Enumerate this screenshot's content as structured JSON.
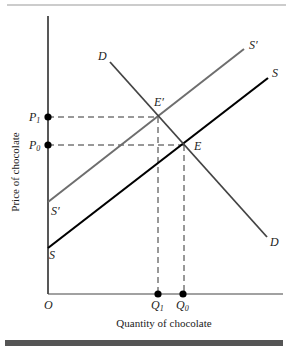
{
  "diagram": {
    "type": "supply-demand",
    "axes": {
      "x_label": "Quantity of chocolate",
      "y_label": "Price of chocolate",
      "origin_label": "O"
    },
    "curves": {
      "demand": {
        "label_start": "D",
        "label_end": "D",
        "color": "#444444"
      },
      "supply": {
        "label_start": "S",
        "label_end": "S",
        "color": "#000000"
      },
      "supply_shifted": {
        "label_start": "S′",
        "label_end": "S′",
        "color": "#6e6e6e"
      }
    },
    "equilibria": {
      "original": {
        "label": "E",
        "price": "P",
        "price_sub": "0",
        "quantity": "Q",
        "quantity_sub": "0"
      },
      "new": {
        "label": "E′",
        "price": "P",
        "price_sub": "1",
        "quantity": "Q",
        "quantity_sub": "1"
      }
    },
    "frame": {
      "top_rule_color": "#9a9a9a",
      "bottom_bar_color": "#555555"
    }
  }
}
